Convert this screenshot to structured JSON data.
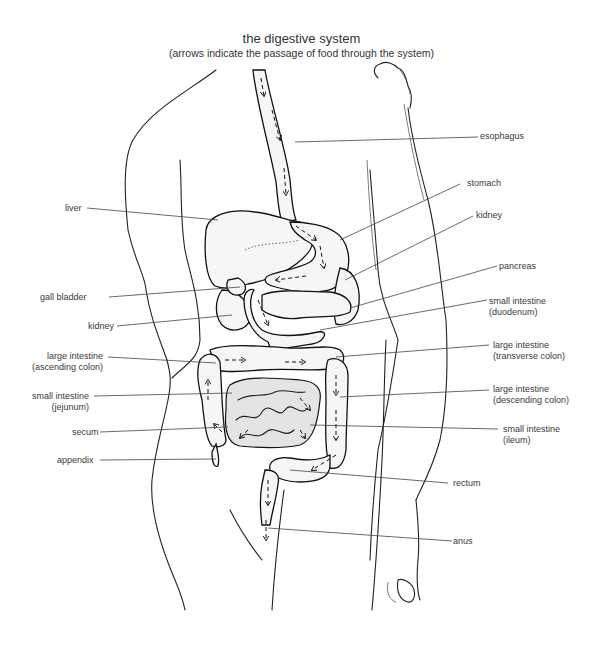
{
  "title": "the digestive system",
  "subtitle": "(arrows indicate the passage of food through the system)",
  "labels": {
    "esophagus": {
      "text": "esophagus",
      "line2": ""
    },
    "liver": {
      "text": "liver",
      "line2": ""
    },
    "stomach": {
      "text": "stomach",
      "line2": ""
    },
    "kidney_right": {
      "text": "kidney",
      "line2": ""
    },
    "pancreas": {
      "text": "pancreas",
      "line2": ""
    },
    "gall_bladder": {
      "text": "gall bladder",
      "line2": ""
    },
    "duodenum": {
      "text": "small intestine",
      "line2": "(duodenum)"
    },
    "kidney_left": {
      "text": "kidney",
      "line2": ""
    },
    "ascending_colon": {
      "text": "large intestine",
      "line2": "(ascending colon)"
    },
    "transverse_colon": {
      "text": "large intestine",
      "line2": "(transverse colon)"
    },
    "jejunum": {
      "text": "small intestine",
      "line2": "(jejunum)"
    },
    "descending_colon": {
      "text": "large intestine",
      "line2": "(descending colon)"
    },
    "secum": {
      "text": "secum",
      "line2": ""
    },
    "ileum": {
      "text": "small intestine",
      "line2": "(ileum)"
    },
    "appendix": {
      "text": "appendix",
      "line2": ""
    },
    "rectum": {
      "text": "rectum",
      "line2": ""
    },
    "anus": {
      "text": "anus",
      "line2": ""
    }
  },
  "colors": {
    "ink": "#222222",
    "label_text": "#3a3a3a",
    "background": "#ffffff"
  }
}
